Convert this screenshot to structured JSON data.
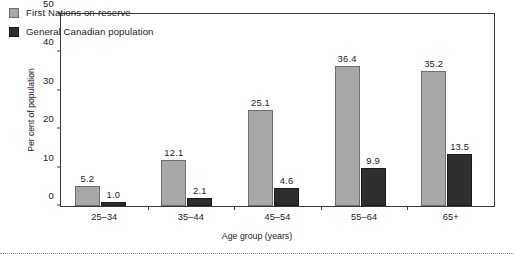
{
  "chart_data": {
    "type": "bar",
    "title": "",
    "subtitle": "",
    "xlabel": "Age group (years)",
    "ylabel": "Per cent of population",
    "categories": [
      "25–34",
      "35–44",
      "45–54",
      "55–64",
      "65+"
    ],
    "series": [
      {
        "name": "First Nations on-reserve",
        "color": "#a8a8a8",
        "values": [
          5.2,
          12.1,
          25.1,
          36.4,
          35.2
        ],
        "labels": [
          "5.2",
          "12.1",
          "25.1",
          "36.4",
          "35.2"
        ]
      },
      {
        "name": "General Canadian population",
        "color": "#2e2e2e",
        "values": [
          1.0,
          2.1,
          4.6,
          9.9,
          13.5
        ],
        "labels": [
          "1.0",
          "2.1",
          "4.6",
          "9.9",
          "13.5"
        ]
      }
    ],
    "ylim": [
      0,
      50
    ],
    "yticks": [
      0,
      10,
      20,
      30,
      40,
      50
    ],
    "ytick_labels": [
      "0",
      "10",
      "20",
      "30",
      "40",
      "50"
    ],
    "grid": false,
    "legend_position": "top-left",
    "data_labels": true,
    "axis_color": "#3a3a3a"
  },
  "legend": {
    "items": [
      {
        "label": "First Nations on-reserve",
        "swatch": "legend-swatch-light-gray"
      },
      {
        "label": "General Canadian population",
        "swatch": "legend-swatch-dark"
      }
    ]
  }
}
